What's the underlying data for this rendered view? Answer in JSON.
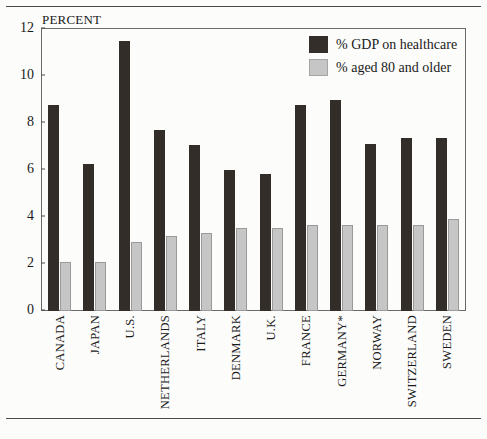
{
  "rules": {
    "top": "horizontal-rule",
    "bottom": "horizontal-rule"
  },
  "axis": {
    "unit_label": "PERCENT",
    "y_ticks": [
      "0",
      "2",
      "4",
      "6",
      "8",
      "10",
      "12"
    ]
  },
  "legend": {
    "items": [
      {
        "label": "% GDP on healthcare",
        "color": "#332e2a",
        "key": "gdp"
      },
      {
        "label": "% aged 80 and older",
        "color": "#c6c6c6",
        "key": "aged80"
      }
    ]
  },
  "chart_data": {
    "type": "bar",
    "title": "",
    "subtitle": "",
    "xlabel": "",
    "ylabel": "PERCENT",
    "ylim": [
      0,
      12
    ],
    "yticks": [
      0,
      2,
      4,
      6,
      8,
      10,
      12
    ],
    "grid": false,
    "legend_position": "top-right",
    "categories": [
      "CANADA",
      "JAPAN",
      "U.S.",
      "NETHERLANDS",
      "ITALY",
      "DENMARK",
      "U.K.",
      "FRANCE",
      "GERMANY*",
      "NORWAY",
      "SWITZERLAND",
      "SWEDEN"
    ],
    "series": [
      {
        "name": "% GDP on healthcare",
        "color": "#332e2a",
        "values": [
          8.75,
          6.25,
          11.5,
          7.7,
          7.05,
          6.0,
          5.85,
          8.75,
          9.0,
          7.1,
          7.35,
          7.35
        ]
      },
      {
        "name": "% aged 80 and older",
        "color": "#c6c6c6",
        "values": [
          2.1,
          2.1,
          2.95,
          3.2,
          3.3,
          3.55,
          3.55,
          3.65,
          3.65,
          3.65,
          3.65,
          3.9
        ]
      }
    ],
    "annotations": [
      "GERMANY*"
    ]
  }
}
